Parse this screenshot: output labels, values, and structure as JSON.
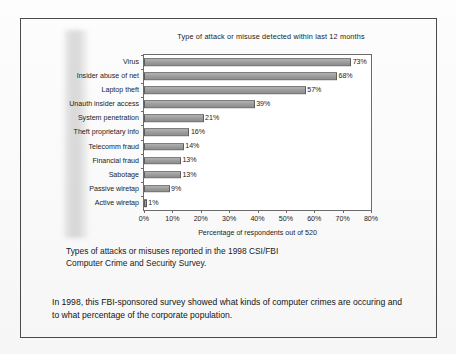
{
  "figure": {
    "caption_line1": "Types of attacks or misuses reported in the 1998 CSI/FBI",
    "caption_line2": "Computer Crime and Security Survey."
  },
  "note": {
    "line1": "In 1998, this FBI-sponsored survey showed what kinds of computer crimes are occuring and",
    "line2": "to what percentage of the corporate population."
  },
  "chart_data": {
    "type": "bar",
    "orientation": "horizontal",
    "title": "Type of attack or misuse detected within last 12 months",
    "xlabel": "Percentage of respondents out of 520",
    "ylabel": "",
    "xlim": [
      0,
      80
    ],
    "xticks": [
      0,
      10,
      20,
      30,
      40,
      50,
      60,
      70,
      80
    ],
    "xtick_labels": [
      "0%",
      "10%",
      "20%",
      "30%",
      "40%",
      "50%",
      "60%",
      "70%",
      "80%"
    ],
    "grid": false,
    "legend": null,
    "bar_color": "#9d9d9d",
    "bar_edge_color": "#5e5e5e",
    "categories": [
      "Virus",
      "Insider abuse of net",
      "Laptop theft",
      "Unauth insider access",
      "System penetration",
      "Theft proprietary info",
      "Telecomm fraud",
      "Financial fraud",
      "Sabotage",
      "Passive wiretap",
      "Active wiretap"
    ],
    "values": [
      73,
      68,
      57,
      39,
      21,
      16,
      14,
      13,
      13,
      9,
      1
    ],
    "value_labels": [
      "73%",
      "68%",
      "57%",
      "39%",
      "21%",
      "16%",
      "14%",
      "13%",
      "13%",
      "9%",
      "1%"
    ]
  }
}
